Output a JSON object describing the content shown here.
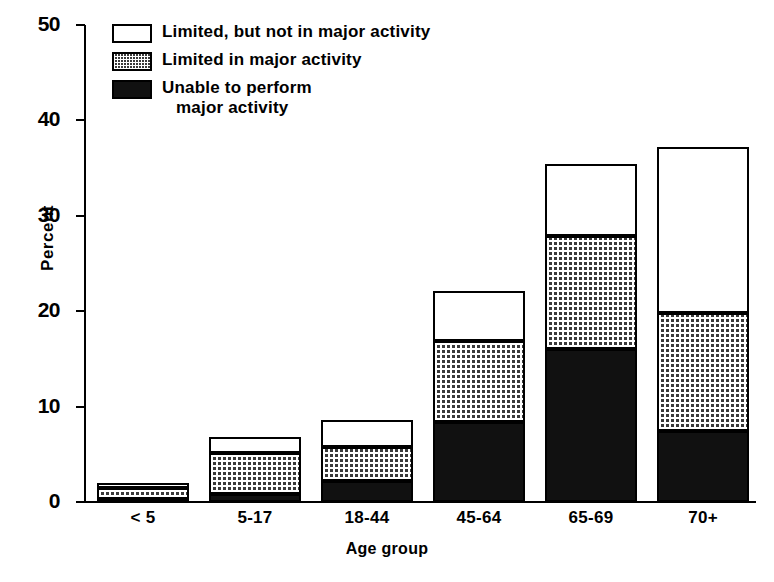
{
  "chart_data": {
    "type": "bar",
    "stacked": true,
    "title": "",
    "xlabel": "Age group",
    "ylabel": "Percent",
    "categories": [
      "< 5",
      "5-17",
      "18-44",
      "45-64",
      "65-69",
      "70+"
    ],
    "ylim": [
      0,
      50
    ],
    "yticks": [
      0,
      10,
      20,
      30,
      40,
      50
    ],
    "grid": false,
    "legend_position": "top-left",
    "series": [
      {
        "name": "Unable to perform major activity",
        "pattern": "solid-black",
        "color": "#111111",
        "values": [
          0.3,
          0.8,
          2.2,
          8.4,
          16.0,
          7.4
        ]
      },
      {
        "name": "Limited in major activity",
        "pattern": "dotted",
        "color": "#3a3a3a",
        "values": [
          1.2,
          4.3,
          3.6,
          8.5,
          11.9,
          12.4
        ]
      },
      {
        "name": "Limited, but not in major activity",
        "pattern": "white",
        "color": "#ffffff",
        "values": [
          0.5,
          1.7,
          2.8,
          5.2,
          7.5,
          17.4
        ]
      }
    ],
    "totals": [
      2.0,
      6.8,
      8.6,
      22.1,
      35.4,
      37.2
    ]
  },
  "legend": {
    "items": [
      {
        "label": "Limited, but not in major activity",
        "label_line2": "",
        "pattern": "white"
      },
      {
        "label": "Limited in major activity",
        "label_line2": "",
        "pattern": "dotted"
      },
      {
        "label": "Unable to perform",
        "label_line2": "major activity",
        "pattern": "black"
      }
    ]
  },
  "axes": {
    "y_label": "Percent",
    "x_label": "Age group",
    "y_ticks": [
      "0",
      "10",
      "20",
      "30",
      "40",
      "50"
    ],
    "x_ticks": [
      "< 5",
      "5-17",
      "18-44",
      "45-64",
      "65-69",
      "70+"
    ]
  }
}
